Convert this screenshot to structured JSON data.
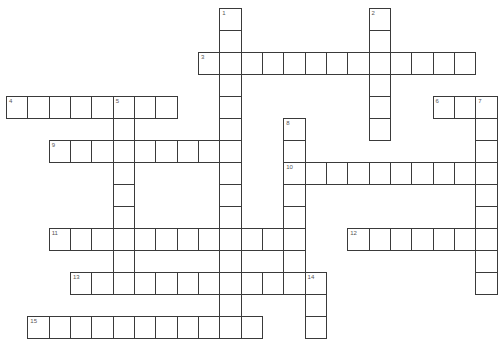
{
  "puzzle": {
    "grid": {
      "origin_x": 6,
      "origin_y": 8,
      "cell_w": 21.33,
      "cell_h": 22
    },
    "colors": {
      "line": "#3a3a3a",
      "number": "#555555",
      "background": "#ffffff"
    },
    "entries": [
      {
        "number": "1",
        "direction": "down",
        "row": 0,
        "col": 10,
        "length": 15
      },
      {
        "number": "2",
        "direction": "down",
        "row": 0,
        "col": 17,
        "length": 6
      },
      {
        "number": "3",
        "direction": "across",
        "row": 2,
        "col": 9,
        "length": 13
      },
      {
        "number": "4",
        "direction": "across",
        "row": 4,
        "col": 0,
        "length": 8
      },
      {
        "number": "5",
        "direction": "down",
        "row": 4,
        "col": 5,
        "length": 9
      },
      {
        "number": "6",
        "direction": "across",
        "row": 4,
        "col": 20,
        "length": 3
      },
      {
        "number": "7",
        "direction": "down",
        "row": 4,
        "col": 22,
        "length": 9
      },
      {
        "number": "8",
        "direction": "down",
        "row": 5,
        "col": 13,
        "length": 8
      },
      {
        "number": "9",
        "direction": "across",
        "row": 6,
        "col": 2,
        "length": 9
      },
      {
        "number": "10",
        "direction": "across",
        "row": 7,
        "col": 13,
        "length": 10
      },
      {
        "number": "11",
        "direction": "across",
        "row": 10,
        "col": 2,
        "length": 12
      },
      {
        "number": "12",
        "direction": "across",
        "row": 10,
        "col": 16,
        "length": 7
      },
      {
        "number": "13",
        "direction": "across",
        "row": 12,
        "col": 3,
        "length": 11
      },
      {
        "number": "14",
        "direction": "down",
        "row": 12,
        "col": 14,
        "length": 3
      },
      {
        "number": "15",
        "direction": "across",
        "row": 14,
        "col": 1,
        "length": 11
      }
    ]
  }
}
